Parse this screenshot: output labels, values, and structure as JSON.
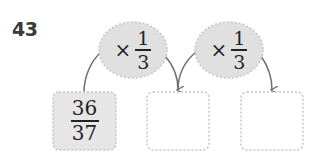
{
  "problem": {
    "number": "43",
    "operations": [
      {
        "symbol": "×",
        "numerator": "1",
        "denominator": "3"
      },
      {
        "symbol": "×",
        "numerator": "1",
        "denominator": "3"
      }
    ],
    "boxes": [
      {
        "numerator": "36",
        "denominator": "37",
        "filled": true
      },
      {
        "numerator": "",
        "denominator": "",
        "filled": false
      },
      {
        "numerator": "",
        "denominator": "",
        "filled": false
      }
    ]
  },
  "colors": {
    "fill": "#e0e0e0",
    "dotted_border": "#c4c4c4",
    "arrow": "#707070",
    "text": "#222222"
  }
}
